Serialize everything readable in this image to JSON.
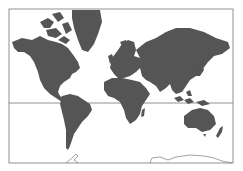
{
  "map": {
    "title": "World map (Mercator projection)",
    "projection": "Mercator",
    "colors": {
      "land": "#555555",
      "ocean": "#ffffff",
      "frame": "#777777",
      "equator": "#777777"
    },
    "features": [
      "North America",
      "Greenland",
      "South America",
      "Europe",
      "Africa",
      "Asia",
      "Australia",
      "New Zealand",
      "Antarctica"
    ],
    "lines": [
      "equator",
      "frame"
    ]
  }
}
